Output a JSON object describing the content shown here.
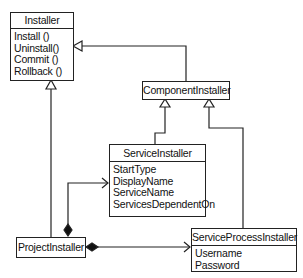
{
  "diagram": {
    "type": "UML class diagram",
    "classes": {
      "installer": {
        "name": "Installer",
        "members": [
          "Install ()",
          "Uninstall()",
          "Commit ()",
          "Rollback ()"
        ]
      },
      "component_installer": {
        "name": "ComponentInstaller",
        "members": []
      },
      "service_installer": {
        "name": "ServiceInstaller",
        "members": [
          "StartType",
          "DisplayName",
          "ServiceName",
          "ServicesDependentOn"
        ]
      },
      "project_installer": {
        "name": "ProjectInstaller",
        "members": []
      },
      "service_process_installer": {
        "name": "ServiceProcessInstaller",
        "members": [
          "Username",
          "Password"
        ]
      }
    },
    "relationships": [
      {
        "type": "inheritance",
        "from": "ComponentInstaller",
        "to": "Installer"
      },
      {
        "type": "inheritance",
        "from": "ProjectInstaller",
        "to": "Installer"
      },
      {
        "type": "inheritance",
        "from": "ServiceInstaller",
        "to": "ComponentInstaller"
      },
      {
        "type": "inheritance",
        "from": "ServiceProcessInstaller",
        "to": "ComponentInstaller"
      },
      {
        "type": "composition",
        "from": "ProjectInstaller",
        "to": "ServiceInstaller"
      },
      {
        "type": "composition",
        "from": "ProjectInstaller",
        "to": "ServiceProcessInstaller"
      }
    ]
  }
}
